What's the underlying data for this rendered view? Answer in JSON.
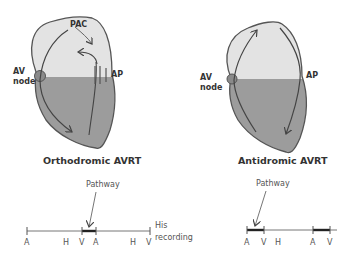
{
  "colors": {
    "atrium": "#e3e3e3",
    "ventricle": "#9c9c9c",
    "outline": "#555555",
    "node": "#8a8a8a",
    "text": "#333333"
  },
  "left_panel": {
    "title": "Orthodromic AVRT",
    "labels": {
      "pac": "PAC",
      "av_node_line1": "AV",
      "av_node_line2": "node",
      "ap": "AP"
    },
    "timeline": {
      "pathway_label": "Pathway",
      "markers": [
        "A",
        "H",
        "V",
        "A",
        "H",
        "V"
      ],
      "side_label_line1": "His",
      "side_label_line2": "recording"
    }
  },
  "right_panel": {
    "title": "Antidromic AVRT",
    "labels": {
      "av_node_line1": "AV",
      "av_node_line2": "node",
      "ap": "AP"
    },
    "timeline": {
      "pathway_label": "Pathway",
      "markers": [
        "A",
        "V",
        "H",
        "A",
        "V"
      ]
    }
  }
}
